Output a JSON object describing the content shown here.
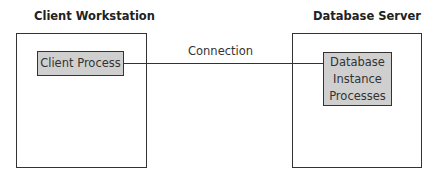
{
  "diagram": {
    "left_node": {
      "title": "Client Workstation",
      "process": "Client Process"
    },
    "right_node": {
      "title": "Database Server",
      "process_lines": [
        "Database",
        "Instance",
        "Processes"
      ]
    },
    "edge": {
      "label": "Connection",
      "from": "Client Process",
      "to": "Database Instance Processes"
    },
    "colors": {
      "process_fill": "#cfcfcf",
      "stroke": "#333333"
    }
  }
}
